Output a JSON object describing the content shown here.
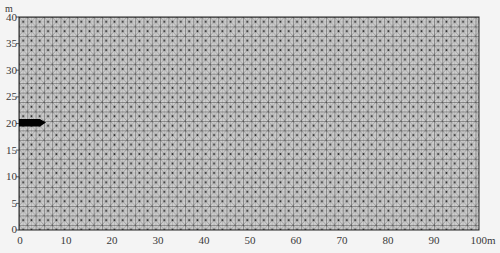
{
  "figure": {
    "type": "finite-element-mesh",
    "y_unit": "m",
    "x_unit_suffix": "m"
  },
  "axes": {
    "x": {
      "range": [
        0,
        100
      ],
      "ticks": [
        {
          "value": 0,
          "label": "0"
        },
        {
          "value": 10,
          "label": "10"
        },
        {
          "value": 20,
          "label": "20"
        },
        {
          "value": 30,
          "label": "30"
        },
        {
          "value": 40,
          "label": "40"
        },
        {
          "value": 50,
          "label": "50"
        },
        {
          "value": 60,
          "label": "60"
        },
        {
          "value": 70,
          "label": "70"
        },
        {
          "value": 80,
          "label": "80"
        },
        {
          "value": 90,
          "label": "90"
        },
        {
          "value": 100,
          "label": "100m"
        }
      ]
    },
    "y": {
      "unit_label": "m",
      "range": [
        0,
        40
      ],
      "ticks": [
        {
          "value": 0,
          "label": "0"
        },
        {
          "value": 5,
          "label": "5"
        },
        {
          "value": 10,
          "label": "10"
        },
        {
          "value": 15,
          "label": "15"
        },
        {
          "value": 20,
          "label": "20"
        },
        {
          "value": 25,
          "label": "25"
        },
        {
          "value": 30,
          "label": "30"
        },
        {
          "value": 35,
          "label": "35"
        },
        {
          "value": 40,
          "label": "40"
        }
      ]
    }
  },
  "mesh": {
    "element_type": "triangular (cells split by both diagonals)",
    "approx_cell_size_m": 1.8,
    "line_color": "#3a3a3a",
    "background_color": "#c8c8c8"
  },
  "inclusion": {
    "shape": "wedge",
    "color": "#000000",
    "x_range_m": [
      0,
      5.7
    ],
    "y_center_m": 20,
    "thickness_m": 1.4
  }
}
